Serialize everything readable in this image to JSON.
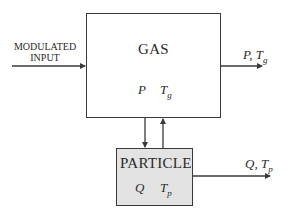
{
  "diagram": {
    "input": {
      "line1": "MODULATED",
      "line2": "INPUT"
    },
    "gas_block": {
      "title": "GAS",
      "var1": "P",
      "var2_main": "T",
      "var2_sub": "g"
    },
    "gas_output": {
      "main": "P, T",
      "sub": "g"
    },
    "particle_block": {
      "title": "PARTICLE",
      "var1": "Q",
      "var2_main": "T",
      "var2_sub": "p"
    },
    "particle_output": {
      "main": "Q, T",
      "sub": "p"
    },
    "colors": {
      "line": "#3a3a3a",
      "particle_fill": "#e3e3e3",
      "gas_fill": "#ffffff"
    }
  }
}
